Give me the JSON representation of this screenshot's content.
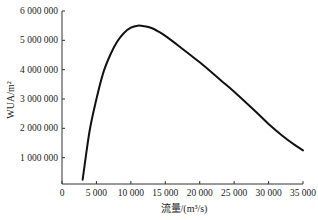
{
  "chart_data": {
    "type": "line",
    "title": "",
    "xlabel": "流量/(m³/s)",
    "ylabel": "WUA/m²",
    "xlim": [
      0,
      35000
    ],
    "ylim": [
      0,
      6000000
    ],
    "grid": false,
    "legend": null,
    "x_ticks": [
      0,
      5000,
      10000,
      15000,
      20000,
      25000,
      30000,
      35000
    ],
    "x_tick_labels": [
      "0",
      "5 000",
      "10 000",
      "15 000",
      "20 000",
      "25 000",
      "30 000",
      "35 000"
    ],
    "y_ticks": [
      1000000,
      2000000,
      3000000,
      4000000,
      5000000,
      6000000
    ],
    "y_tick_labels": [
      "1 000 000",
      "2 000 000",
      "3 000 000",
      "4 000 000",
      "5 000 000",
      "6 000 000"
    ],
    "series": [
      {
        "name": "WUA",
        "x": [
          3000,
          4000,
          5000,
          6000,
          7000,
          8000,
          9000,
          10000,
          11000,
          12000,
          13000,
          14000,
          15000,
          17000,
          20000,
          23000,
          25000,
          28000,
          30000,
          32000,
          34000,
          35000
        ],
        "values": [
          250000,
          1900000,
          3000000,
          3900000,
          4500000,
          4950000,
          5250000,
          5430000,
          5500000,
          5480000,
          5420000,
          5300000,
          5150000,
          4800000,
          4250000,
          3650000,
          3250000,
          2600000,
          2150000,
          1750000,
          1400000,
          1250000
        ]
      }
    ]
  },
  "labels": {
    "x_axis_title": "流量/(m³/s)",
    "y_axis_title": "WUA/m²"
  }
}
